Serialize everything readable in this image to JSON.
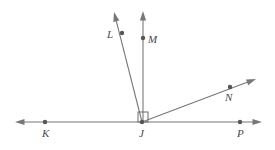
{
  "figure": {
    "name": "ray-diagram-vertex-J",
    "type": "geometry-diagram",
    "width": 275,
    "height": 150,
    "background_color": "#ffffff",
    "stroke_color": "#777777",
    "label_color": "#4a4a4a",
    "point_color": "#555555",
    "line_width": 1.1
  },
  "labels": {
    "K": "K",
    "J": "J",
    "P": "P",
    "L": "L",
    "M": "M",
    "N": "N"
  },
  "chart_data": {
    "type": "scatter",
    "title": "",
    "xlabel": "",
    "ylabel": "",
    "vertex": {
      "label": "J",
      "x": 142,
      "y": 122
    },
    "points": [
      {
        "label": "K",
        "x": 45,
        "y": 122,
        "label_x": 42,
        "label_y": 128,
        "dot": true
      },
      {
        "label": "J",
        "x": 142,
        "y": 122,
        "label_x": 139,
        "label_y": 128,
        "dot": true
      },
      {
        "label": "P",
        "x": 240,
        "y": 122,
        "label_x": 237,
        "label_y": 128,
        "dot": true
      },
      {
        "label": "L",
        "x": 122,
        "y": 33,
        "label_x": 107,
        "label_y": 29,
        "dot": true
      },
      {
        "label": "M",
        "x": 143,
        "y": 38,
        "label_x": 148,
        "label_y": 34,
        "dot": true
      },
      {
        "label": "N",
        "x": 230,
        "y": 87,
        "label_x": 225,
        "label_y": 92,
        "dot": true
      }
    ],
    "segments": [
      {
        "name": "line-KP",
        "x1": 15,
        "y1": 122,
        "x2": 262,
        "y2": 122,
        "arrow_start": true,
        "arrow_end": true
      },
      {
        "name": "ray-JL",
        "x1": 142,
        "y1": 122,
        "x2": 114,
        "y2": 12,
        "arrow_start": false,
        "arrow_end": true
      },
      {
        "name": "ray-JM",
        "x1": 143,
        "y1": 122,
        "x2": 143,
        "y2": 11,
        "arrow_start": false,
        "arrow_end": true
      },
      {
        "name": "ray-JN",
        "x1": 142,
        "y1": 122,
        "x2": 256,
        "y2": 79,
        "arrow_start": false,
        "arrow_end": true
      }
    ],
    "right_angle_marker": {
      "name": "right-angle-MJN",
      "at_vertex": "J",
      "between_rays": [
        "JM",
        "JN"
      ],
      "size": 10,
      "x": 138,
      "y": 112
    }
  }
}
